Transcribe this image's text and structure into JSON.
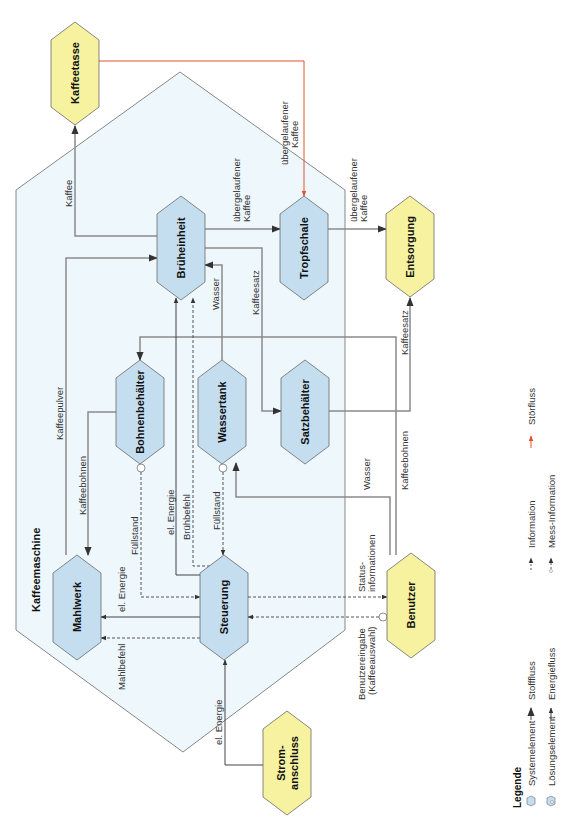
{
  "system": {
    "label": "Kaffeemaschine",
    "fill": "#eef7fb",
    "stroke": "#6a6a6a"
  },
  "colors": {
    "system_element_fill": "#c4def0",
    "solution_element_fill": "#f7f2a0",
    "element_stroke": "#6a6a6a",
    "stoff_line": "#8a8a8a",
    "energie_line": "#444444",
    "info_line": "#555555",
    "stoer_line": "#e0502e"
  },
  "nodes": {
    "kaffeetasse": "Kaffeetasse",
    "brueheinheit": "Brüheinheit",
    "tropfschale": "Tropfschale",
    "entsorgung": "Entsorgung",
    "bohnenbehaelter": "Bohnenbehälter",
    "wassertank": "Wassertank",
    "satzbehaelter": "Satzbehälter",
    "mahlwerk": "Mahlwerk",
    "steuerung": "Steuerung",
    "benutzer": "Benutzer",
    "stromanschluss_1": "Strom-",
    "stromanschluss_2": "anschluss"
  },
  "flows": {
    "kaffee": "Kaffee",
    "uebergelaufen_1a": "übergelaufener",
    "uebergelaufen_1b": "Kaffee",
    "uebergelaufen_2a": "übergelaufener",
    "uebergelaufen_2b": "Kaffee",
    "uebergelaufen_3a": "übergelaufener",
    "uebergelaufen_3b": "Kaffee",
    "kaffeepulver": "Kaffeepulver",
    "kaffeebohnen_1": "Kaffeebohnen",
    "kaffeebohnen_2": "Kaffeebohnen",
    "wasser_1": "Wasser",
    "wasser_2": "Wasser",
    "kaffeesatz_1": "Kaffeesatz",
    "kaffeesatz_2": "Kaffeesatz",
    "fuellstand_1": "Füllstand",
    "fuellstand_2": "Füllstand",
    "el_energie_1": "el. Energie",
    "el_energie_2": "el. Energie",
    "el_energie_3": "el. Energie",
    "bruehbefehl": "Brühbefehl",
    "mahlbefehl": "Mahlbefehl",
    "status_1": "Status-",
    "status_2": "informationen",
    "benutzereingabe_1": "Benutzereingabe",
    "benutzereingabe_2": "(Kaffeeauswahl)"
  },
  "legend": {
    "title": "Legende",
    "items": [
      {
        "label": "Systemelement",
        "icon": "hexagon-blue-icon"
      },
      {
        "label": "Lösungselement",
        "icon": "hexagon-blue-circle-icon"
      },
      {
        "label": "Stofffluss",
        "icon": "arrow-gray-icon"
      },
      {
        "label": "Energiefluss",
        "icon": "arrow-dark-icon"
      },
      {
        "label": "Information",
        "icon": "arrow-dashed-icon"
      },
      {
        "label": "Mess-Information",
        "icon": "arrow-circle-dashed-icon"
      },
      {
        "label": "Störfluss",
        "icon": "arrow-red-icon"
      }
    ]
  }
}
